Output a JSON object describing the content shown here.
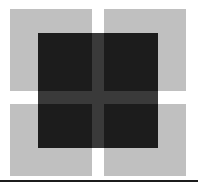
{
  "figure": {
    "title": "",
    "caption": "",
    "width": 198,
    "height": 185,
    "background_color": "#ffffff",
    "shapes": {
      "light_square": {
        "name": "light-gray-square",
        "color": "#c0c0c0",
        "gap_color": "#ffffff",
        "quadrants": [
          {
            "id": "top-left",
            "label": ""
          },
          {
            "id": "top-right",
            "label": ""
          },
          {
            "id": "bottom-left",
            "label": ""
          },
          {
            "id": "bottom-right",
            "label": ""
          }
        ]
      },
      "dark_square": {
        "name": "dark-square",
        "color": "#1c1c1c",
        "cross_color": "#3a3a3a",
        "quadrants": [
          {
            "id": "top-left",
            "label": ""
          },
          {
            "id": "top-right",
            "label": ""
          },
          {
            "id": "bottom-left",
            "label": ""
          },
          {
            "id": "bottom-right",
            "label": ""
          }
        ]
      },
      "bottom_rule": {
        "name": "bottom-rule",
        "color": "#1c1c1c"
      }
    }
  }
}
